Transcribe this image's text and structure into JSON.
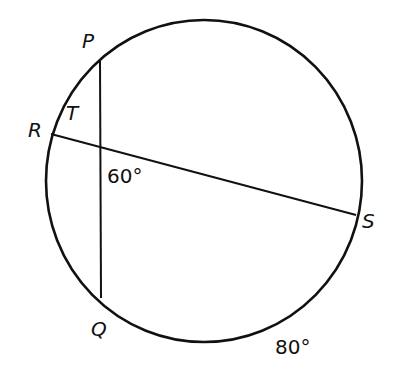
{
  "diagram": {
    "type": "circle-intersecting-chords",
    "colors": {
      "stroke": "#111111",
      "background": "#ffffff"
    },
    "points": {
      "P": {
        "label": "P"
      },
      "Q": {
        "label": "Q"
      },
      "R": {
        "label": "R"
      },
      "S": {
        "label": "S"
      },
      "T": {
        "label": "T"
      }
    },
    "chords": [
      "PQ",
      "RS"
    ],
    "angle_label": "60°",
    "arc_label": "80°"
  }
}
